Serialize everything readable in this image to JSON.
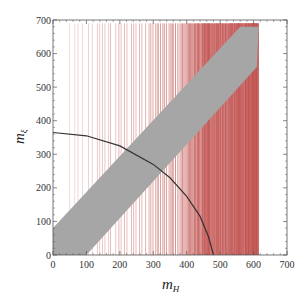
{
  "chart_data": {
    "type": "scatter",
    "title": "",
    "xlabel": "m_H",
    "ylabel": "m_ξ",
    "xlabel_main": "m",
    "xlabel_sub": "H",
    "ylabel_main": "m",
    "ylabel_sub": "ξ",
    "xlim": [
      0,
      700
    ],
    "ylim": [
      0,
      700
    ],
    "grid": false,
    "legend": null,
    "x_ticks": [
      0,
      100,
      200,
      300,
      400,
      500,
      600,
      700
    ],
    "y_ticks": [
      0,
      100,
      200,
      300,
      400,
      500,
      600,
      700
    ],
    "x_tick_labels": [
      "0",
      "100",
      "200",
      "300",
      "400",
      "500",
      "600",
      "700"
    ],
    "y_tick_labels": [
      "0",
      "100",
      "200",
      "300",
      "400",
      "500",
      "600",
      "700"
    ],
    "series": [
      {
        "name": "excluded m_H vertical lines",
        "kind": "vertical_lines",
        "color": "#c0504d",
        "x_range": [
          50,
          615
        ],
        "y_range": [
          0,
          690
        ],
        "note": "Dense red vertical lines, sparse near m_H≈50-150, nearly solid for m_H≈400-610"
      },
      {
        "name": "allowed band",
        "kind": "filled_region",
        "color": "#a6a6a6",
        "polygon": [
          [
            0,
            0
          ],
          [
            100,
            0
          ],
          [
            610,
            560
          ],
          [
            615,
            680
          ],
          [
            560,
            680
          ],
          [
            0,
            80
          ]
        ]
      },
      {
        "name": "constraint curve",
        "kind": "line",
        "color": "#333333",
        "points": [
          [
            0,
            365
          ],
          [
            100,
            355
          ],
          [
            200,
            325
          ],
          [
            300,
            270
          ],
          [
            350,
            230
          ],
          [
            400,
            175
          ],
          [
            440,
            115
          ],
          [
            465,
            55
          ],
          [
            480,
            0
          ]
        ]
      }
    ]
  },
  "colors": {
    "line_red": "#c0504d",
    "band_gray": "#a6a6a6",
    "curve": "#333333",
    "frame": "#555555"
  }
}
